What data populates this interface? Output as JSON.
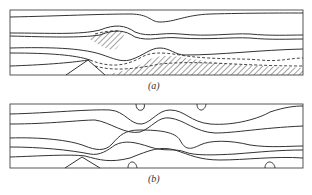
{
  "figure": {
    "panels": [
      {
        "id": "a",
        "label": "(a)",
        "description": "Streamlines over an obstacle with hatched separated-flow regions and dashed dividing lines"
      },
      {
        "id": "b",
        "label": "(b)",
        "description": "Streamlines over an obstacle with wavy lee-wave pattern and closed recirculation lobes"
      }
    ]
  },
  "colors": {
    "line": "#333333",
    "background": "#ffffff"
  }
}
